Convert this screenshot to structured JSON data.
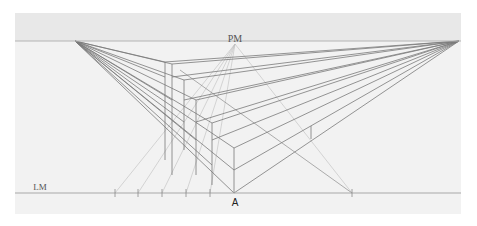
{
  "diagram": {
    "colors": {
      "page": "#ffffff",
      "paper": "#f2f2f2",
      "sky": "#e8e8e8",
      "horizon": "#b4b4b4",
      "ground_line": "#a8a8a8",
      "construction": "#7a7a7a",
      "measure": "#bdbdbd"
    },
    "paper": {
      "x": 15,
      "y": 13,
      "w": 446,
      "h": 201
    },
    "horizon_y": 41,
    "ground_line_y": 193,
    "labels": {
      "pm": {
        "text": "PM",
        "x": 235,
        "y": 42
      },
      "lm": {
        "text": "LM",
        "x": 40,
        "y": 190
      },
      "a": {
        "text": "A",
        "x": 235,
        "y": 206
      }
    },
    "vanishing_points": {
      "left": {
        "x": 75,
        "y": 41
      },
      "right": {
        "x": 459,
        "y": 41
      },
      "pm": {
        "x": 235,
        "y": 44
      }
    },
    "ground_ticks": [
      115,
      138,
      162,
      186,
      210,
      352
    ],
    "steps": [
      {
        "x": 165,
        "top": 62,
        "bottom": 77,
        "rx": 460,
        "note": "top step"
      },
      {
        "x": 172,
        "top": 64,
        "bottom": 100
      },
      {
        "x": 184,
        "top": 80,
        "bottom": 122
      },
      {
        "x": 196,
        "top": 100,
        "bottom": 140
      },
      {
        "x": 212,
        "top": 123,
        "bottom": 165
      },
      {
        "x": 234,
        "top": 148,
        "bottom": 193
      }
    ],
    "left_edge_x": 165,
    "step_heights": [
      62,
      80,
      100,
      123,
      148,
      170
    ],
    "front_corner": {
      "x": 234,
      "top": 170,
      "bottom": 193
    },
    "right_corner": {
      "x": 311,
      "top": 126,
      "bottom": 139
    }
  }
}
